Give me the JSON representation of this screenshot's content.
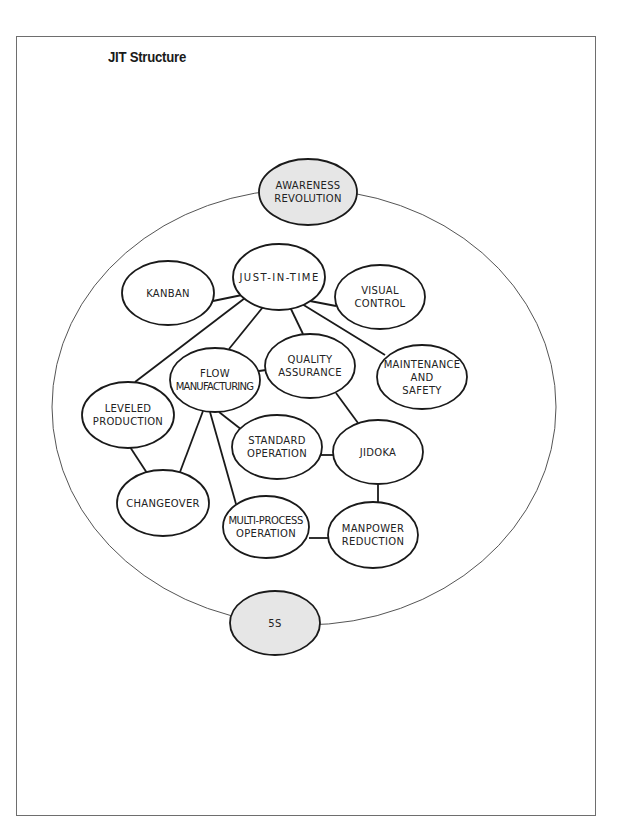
{
  "page": {
    "title": "JIT Structure"
  },
  "diagram": {
    "outer_ring": {
      "cx": 304,
      "cy": 407,
      "rx": 252,
      "ry": 218,
      "stroke": "#555555"
    },
    "colors": {
      "highlight_fill": "#e6e6e6",
      "node_fill": "#ffffff",
      "stroke": "#1a1a1a"
    },
    "nodes": [
      {
        "id": "awareness",
        "lines": [
          "AWARENESS",
          "REVOLUTION"
        ],
        "cx": 308,
        "cy": 192,
        "rx": 49,
        "ry": 33,
        "highlight": true
      },
      {
        "id": "jit",
        "lines": [
          "JUST-IN-TIME"
        ],
        "cx": 279,
        "cy": 277,
        "rx": 46,
        "ry": 33,
        "highlight": false
      },
      {
        "id": "kanban",
        "lines": [
          "KANBAN"
        ],
        "cx": 168,
        "cy": 293,
        "rx": 46,
        "ry": 32,
        "highlight": false
      },
      {
        "id": "visual",
        "lines": [
          "VISUAL",
          "CONTROL"
        ],
        "cx": 380,
        "cy": 297,
        "rx": 45,
        "ry": 32,
        "highlight": false
      },
      {
        "id": "quality",
        "lines": [
          "QUALITY",
          "ASSURANCE"
        ],
        "cx": 310,
        "cy": 366,
        "rx": 45,
        "ry": 32,
        "highlight": false
      },
      {
        "id": "flow",
        "lines": [
          "FLOW",
          "MANUFACTURING"
        ],
        "cx": 215,
        "cy": 380,
        "rx": 45,
        "ry": 32,
        "highlight": false
      },
      {
        "id": "maintenance",
        "lines": [
          "MAINTENANCE",
          "AND",
          "SAFETY"
        ],
        "cx": 422,
        "cy": 377,
        "rx": 45,
        "ry": 32,
        "highlight": false
      },
      {
        "id": "leveled",
        "lines": [
          "LEVELED",
          "PRODUCTION"
        ],
        "cx": 128,
        "cy": 415,
        "rx": 46,
        "ry": 33,
        "highlight": false
      },
      {
        "id": "standard",
        "lines": [
          "STANDARD",
          "OPERATION"
        ],
        "cx": 277,
        "cy": 447,
        "rx": 45,
        "ry": 32,
        "highlight": false
      },
      {
        "id": "jidoka",
        "lines": [
          "JIDOKA"
        ],
        "cx": 378,
        "cy": 452,
        "rx": 45,
        "ry": 32,
        "highlight": false
      },
      {
        "id": "changeover",
        "lines": [
          "CHANGEOVER"
        ],
        "cx": 163,
        "cy": 503,
        "rx": 46,
        "ry": 33,
        "highlight": false
      },
      {
        "id": "multi",
        "lines": [
          "MULTI-PROCESS",
          "OPERATION"
        ],
        "cx": 266,
        "cy": 527,
        "rx": 43,
        "ry": 31,
        "highlight": false
      },
      {
        "id": "manpower",
        "lines": [
          "MANPOWER",
          "REDUCTION"
        ],
        "cx": 373,
        "cy": 535,
        "rx": 45,
        "ry": 33,
        "highlight": false
      },
      {
        "id": "fives",
        "lines": [
          "5S"
        ],
        "cx": 275,
        "cy": 623,
        "rx": 45,
        "ry": 32,
        "highlight": true
      }
    ],
    "edges": [
      {
        "from": "jit",
        "to": "kanban",
        "x1": 242,
        "y1": 295,
        "x2": 213,
        "y2": 301
      },
      {
        "from": "jit",
        "to": "visual",
        "x1": 310,
        "y1": 301,
        "x2": 336,
        "y2": 306
      },
      {
        "from": "jit",
        "to": "leveled",
        "x1": 245,
        "y1": 298,
        "x2": 135,
        "y2": 382
      },
      {
        "from": "jit",
        "to": "flow",
        "x1": 263,
        "y1": 307,
        "x2": 229,
        "y2": 349
      },
      {
        "from": "jit",
        "to": "quality",
        "x1": 290,
        "y1": 307,
        "x2": 303,
        "y2": 334
      },
      {
        "from": "jit",
        "to": "maintenance",
        "x1": 302,
        "y1": 304,
        "x2": 385,
        "y2": 355
      },
      {
        "from": "flow",
        "to": "quality",
        "x1": 259,
        "y1": 371,
        "x2": 266,
        "y2": 370
      },
      {
        "from": "quality",
        "to": "jidoka",
        "x1": 336,
        "y1": 393,
        "x2": 358,
        "y2": 423
      },
      {
        "from": "flow",
        "to": "standard",
        "x1": 219,
        "y1": 412,
        "x2": 242,
        "y2": 430
      },
      {
        "from": "flow",
        "to": "changeover",
        "x1": 203,
        "y1": 411,
        "x2": 180,
        "y2": 472
      },
      {
        "from": "flow",
        "to": "multi",
        "x1": 210,
        "y1": 412,
        "x2": 236,
        "y2": 504
      },
      {
        "from": "leveled",
        "to": "changeover",
        "x1": 130,
        "y1": 447,
        "x2": 147,
        "y2": 473
      },
      {
        "from": "standard",
        "to": "jidoka",
        "x1": 320,
        "y1": 455,
        "x2": 334,
        "y2": 455
      },
      {
        "from": "jidoka",
        "to": "manpower",
        "x1": 378,
        "y1": 484,
        "x2": 378,
        "y2": 502
      },
      {
        "from": "multi",
        "to": "manpower",
        "x1": 309,
        "y1": 538,
        "x2": 328,
        "y2": 538
      }
    ]
  }
}
